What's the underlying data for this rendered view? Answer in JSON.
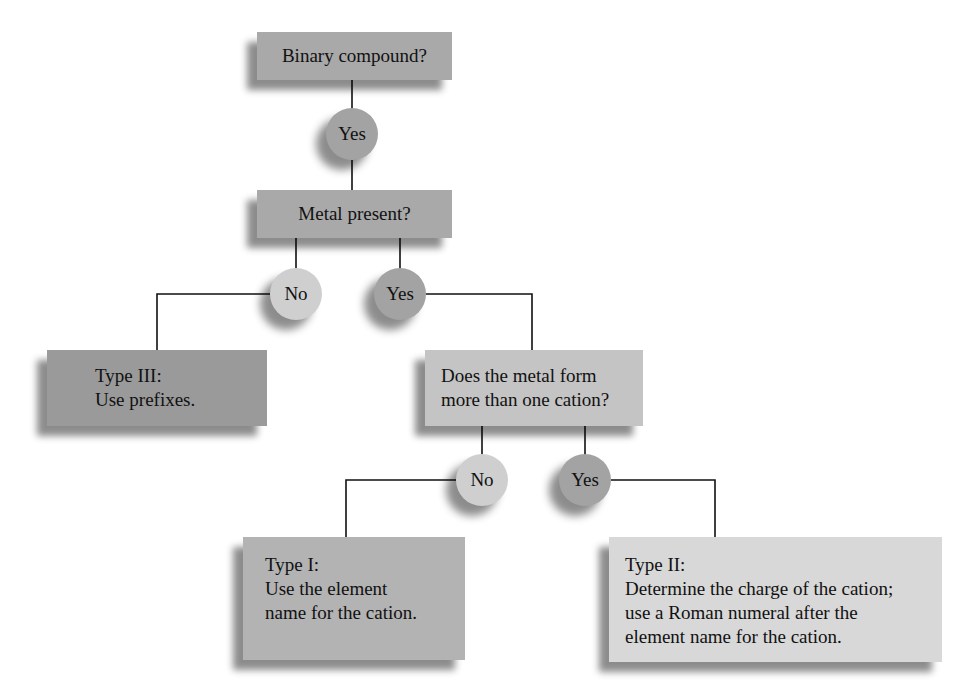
{
  "colors": {
    "box_medium": "#a9a9a9",
    "box_dark": "#9a9a9a",
    "box_light": "#c4c4c4",
    "box_lightest": "#d8d8d8",
    "circle_yes": "#a3a3a3",
    "circle_no": "#cfcfcf",
    "line": "#111111"
  },
  "nodes": {
    "binary": {
      "text": "Binary compound?"
    },
    "yes1": {
      "text": "Yes"
    },
    "metal": {
      "text": "Metal present?"
    },
    "no2": {
      "text": "No"
    },
    "yes2": {
      "text": "Yes"
    },
    "type3": {
      "text": "Type III:\nUse prefixes."
    },
    "cation_q": {
      "text": "Does the metal form\nmore than one cation?"
    },
    "no3": {
      "text": "No"
    },
    "yes3": {
      "text": "Yes"
    },
    "type1": {
      "text": "Type I:\nUse the element\nname for the cation."
    },
    "type2": {
      "text": "Type II:\nDetermine the charge of the cation;\nuse a Roman numeral after the\nelement name for the cation."
    }
  }
}
